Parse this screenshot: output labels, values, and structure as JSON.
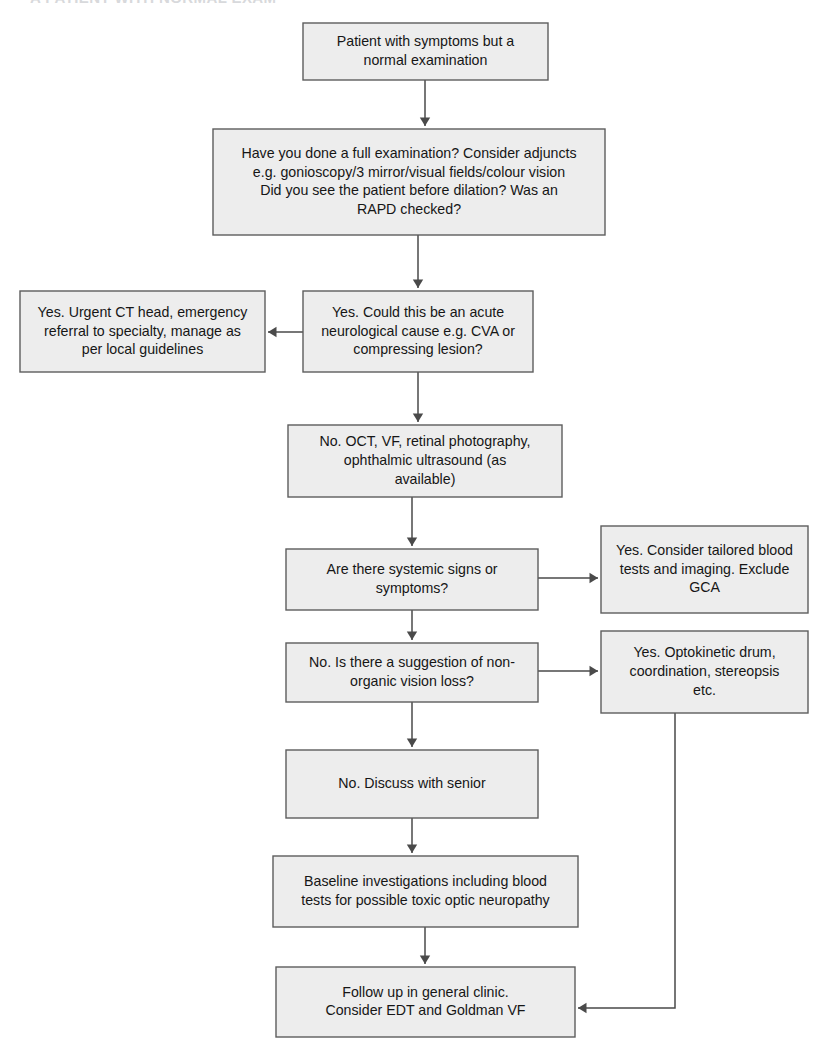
{
  "page": {
    "title_remnant": "A PATIENT WITH NORMAL EXAM",
    "background_color": "#ffffff",
    "node_fill": "#ededed",
    "node_border": "#5d5d5d",
    "edge_color": "#4a4a4a",
    "text_color": "#161616"
  },
  "chart_data": {
    "type": "diagram",
    "subtype": "flowchart",
    "title": "",
    "orientation": "top-to-bottom",
    "node_count": 11,
    "edge_count": 10,
    "nodes": [
      {
        "id": "n1",
        "lines": [
          "Patient with symptoms but a",
          "normal examination"
        ],
        "x": 303,
        "y": 23,
        "w": 245,
        "h": 57
      },
      {
        "id": "n2",
        "lines": [
          "Have you done a full examination? Consider adjuncts",
          "e.g. gonioscopy/3 mirror/visual fields/colour vision",
          "Did you see the patient before dilation? Was an",
          "RAPD checked?"
        ],
        "x": 213,
        "y": 129,
        "w": 392,
        "h": 106
      },
      {
        "id": "n3",
        "lines": [
          "Yes. Could this be an acute",
          "neurological cause e.g. CVA or",
          "compressing lesion?"
        ],
        "x": 303,
        "y": 291,
        "w": 230,
        "h": 81
      },
      {
        "id": "n4",
        "lines": [
          "Yes. Urgent CT head, emergency",
          "referral to specialty, manage as",
          "per local guidelines"
        ],
        "x": 20,
        "y": 291,
        "w": 245,
        "h": 81
      },
      {
        "id": "n5",
        "lines": [
          "No. OCT, VF, retinal photography,",
          "ophthalmic ultrasound (as",
          "available)"
        ],
        "x": 288,
        "y": 425,
        "w": 274,
        "h": 72
      },
      {
        "id": "n6",
        "lines": [
          "Are there systemic signs or",
          "symptoms?"
        ],
        "x": 286,
        "y": 549,
        "w": 252,
        "h": 61
      },
      {
        "id": "n7",
        "lines": [
          "Yes. Consider tailored blood",
          "tests and imaging. Exclude",
          "GCA"
        ],
        "x": 601,
        "y": 526,
        "w": 207,
        "h": 87
      },
      {
        "id": "n8",
        "lines": [
          "No. Is there a suggestion of non-",
          "organic vision loss?"
        ],
        "x": 286,
        "y": 643,
        "w": 252,
        "h": 59
      },
      {
        "id": "n9",
        "lines": [
          "Yes. Optokinetic drum,",
          "coordination, stereopsis",
          "etc."
        ],
        "x": 601,
        "y": 631,
        "w": 207,
        "h": 82
      },
      {
        "id": "n10",
        "lines": [
          "No. Discuss with senior"
        ],
        "x": 286,
        "y": 750,
        "w": 252,
        "h": 68
      },
      {
        "id": "n11",
        "lines": [
          "Baseline investigations including blood",
          "tests for possible toxic optic neuropathy"
        ],
        "x": 273,
        "y": 856,
        "w": 305,
        "h": 71
      },
      {
        "id": "n12",
        "lines": [
          "Follow up in general clinic.",
          "Consider EDT and Goldman VF"
        ],
        "x": 276,
        "y": 967,
        "w": 299,
        "h": 70
      }
    ],
    "edges": [
      {
        "id": "e1",
        "from": "n1",
        "to": "n2",
        "label": "",
        "kind": "vertical",
        "points": [
          [
            425,
            80
          ],
          [
            425,
            126
          ]
        ]
      },
      {
        "id": "e2",
        "from": "n2",
        "to": "n3",
        "label": "",
        "kind": "vertical",
        "points": [
          [
            418,
            235
          ],
          [
            418,
            288
          ]
        ]
      },
      {
        "id": "e3",
        "from": "n3",
        "to": "n4",
        "label": "Yes",
        "kind": "horizontal-left",
        "points": [
          [
            303,
            332
          ],
          [
            268,
            332
          ]
        ]
      },
      {
        "id": "e4",
        "from": "n3",
        "to": "n5",
        "label": "No",
        "kind": "vertical",
        "points": [
          [
            418,
            372
          ],
          [
            418,
            422
          ]
        ]
      },
      {
        "id": "e5",
        "from": "n5",
        "to": "n6",
        "label": "",
        "kind": "vertical",
        "points": [
          [
            412,
            497
          ],
          [
            412,
            546
          ]
        ]
      },
      {
        "id": "e6",
        "from": "n6",
        "to": "n7",
        "label": "Yes",
        "kind": "horizontal-right",
        "points": [
          [
            538,
            578
          ],
          [
            598,
            578
          ]
        ]
      },
      {
        "id": "e7",
        "from": "n6",
        "to": "n8",
        "label": "No",
        "kind": "vertical",
        "points": [
          [
            412,
            610
          ],
          [
            412,
            640
          ]
        ]
      },
      {
        "id": "e8",
        "from": "n8",
        "to": "n9",
        "label": "Yes",
        "kind": "horizontal-right",
        "points": [
          [
            538,
            671
          ],
          [
            598,
            671
          ]
        ]
      },
      {
        "id": "e9",
        "from": "n8",
        "to": "n10",
        "label": "No",
        "kind": "vertical",
        "points": [
          [
            412,
            702
          ],
          [
            412,
            747
          ]
        ]
      },
      {
        "id": "e10",
        "from": "n10",
        "to": "n11",
        "label": "",
        "kind": "vertical",
        "points": [
          [
            412,
            818
          ],
          [
            412,
            853
          ]
        ]
      },
      {
        "id": "e11",
        "from": "n11",
        "to": "n12",
        "label": "",
        "kind": "vertical",
        "points": [
          [
            425,
            927
          ],
          [
            425,
            964
          ]
        ]
      },
      {
        "id": "e12",
        "from": "n9",
        "to": "n12",
        "label": "",
        "kind": "elbow",
        "points": [
          [
            675,
            713
          ],
          [
            675,
            1008
          ],
          [
            578,
            1008
          ]
        ]
      }
    ]
  }
}
